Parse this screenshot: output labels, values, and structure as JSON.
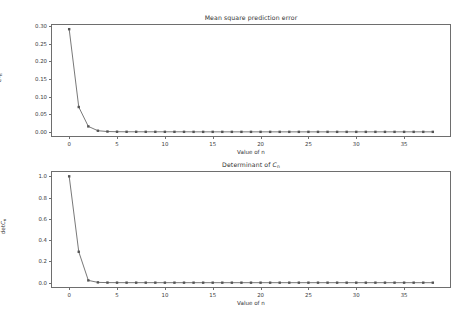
{
  "figure": {
    "background_color": "#ffffff",
    "line_color": "#555555",
    "frame_color": "#6e6e6e",
    "marker": "square"
  },
  "panels": {
    "top": {
      "title": "Mean square prediction error",
      "xlabel": "Value of n",
      "ylabel_main": "e",
      "ylabel_sup": "2",
      "ylabel_sub": "n",
      "yticks": [
        "0.00",
        "0.05",
        "0.10",
        "0.15",
        "0.20",
        "0.25",
        "0.30"
      ],
      "xticks": [
        "0",
        "5",
        "10",
        "15",
        "20",
        "25",
        "30",
        "35"
      ]
    },
    "bottom": {
      "title_main": "Determinant of ",
      "title_italic": "C",
      "title_sub": "n",
      "xlabel": "Value of n",
      "ylabel_main": "det",
      "ylabel_italic": "C",
      "ylabel_sub": "n",
      "yticks": [
        "0.0",
        "0.2",
        "0.4",
        "0.6",
        "0.8",
        "1.0"
      ],
      "xticks": [
        "0",
        "5",
        "10",
        "15",
        "20",
        "25",
        "30",
        "35"
      ]
    }
  },
  "chart_data": [
    {
      "type": "line",
      "title": "Mean square prediction error",
      "xlabel": "Value of n",
      "ylabel": "e^2_n",
      "xlim": [
        -1.9,
        39.9
      ],
      "ylim": [
        -0.0146,
        0.3062
      ],
      "grid": false,
      "legend": "none",
      "marker": "square",
      "x": [
        0,
        1,
        2,
        3,
        4,
        5,
        6,
        7,
        8,
        9,
        10,
        11,
        12,
        13,
        14,
        15,
        16,
        17,
        18,
        19,
        20,
        21,
        22,
        23,
        24,
        25,
        26,
        27,
        28,
        29,
        30,
        31,
        32,
        33,
        34,
        35,
        36,
        37,
        38
      ],
      "y": [
        0.2915,
        0.0705,
        0.0155,
        0.0032,
        0.0009,
        0.0004,
        0.0002,
        0.0002,
        0.0001,
        0.0001,
        0.0001,
        0.0001,
        0.0001,
        0.0,
        0.0,
        0.0,
        0.0,
        0.0,
        0.0,
        0.0,
        0.0,
        0.0,
        0.0,
        0.0,
        0.0,
        0.0,
        0.0,
        0.0,
        0.0,
        0.0,
        0.0,
        0.0,
        0.0,
        0.0,
        0.0,
        0.0,
        0.0,
        0.0,
        0.0
      ]
    },
    {
      "type": "line",
      "title": "Determinant of C_n",
      "xlabel": "Value of n",
      "ylabel": "detC_n",
      "xlim": [
        -1.9,
        39.9
      ],
      "ylim": [
        -0.05,
        1.05
      ],
      "grid": false,
      "legend": "none",
      "marker": "square",
      "x": [
        0,
        1,
        2,
        3,
        4,
        5,
        6,
        7,
        8,
        9,
        10,
        11,
        12,
        13,
        14,
        15,
        16,
        17,
        18,
        19,
        20,
        21,
        22,
        23,
        24,
        25,
        26,
        27,
        28,
        29,
        30,
        31,
        32,
        33,
        34,
        35,
        36,
        37,
        38
      ],
      "y": [
        1.0,
        0.2905,
        0.0215,
        0.0028,
        0.0008,
        0.0003,
        0.0002,
        0.0001,
        0.0001,
        0.0001,
        0.0,
        0.0,
        0.0,
        0.0,
        0.0,
        0.0,
        0.0,
        0.0,
        0.0,
        0.0,
        0.0,
        0.0,
        0.0,
        0.0,
        0.0,
        0.0,
        0.0,
        0.0,
        0.0,
        0.0,
        0.0,
        0.0,
        0.0,
        0.0,
        0.0,
        0.0,
        0.0,
        0.0,
        0.0
      ]
    }
  ]
}
